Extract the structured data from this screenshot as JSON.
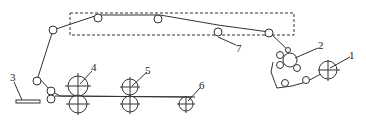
{
  "diagram": {
    "type": "web-path-roller-schematic",
    "colors": {
      "stroke": "#333333",
      "background": "#ffffff"
    },
    "labels": [
      {
        "id": "1",
        "text": "1",
        "x": 349,
        "y": 52
      },
      {
        "id": "2",
        "text": "2",
        "x": 318,
        "y": 42
      },
      {
        "id": "3",
        "text": "3",
        "x": 9,
        "y": 74
      },
      {
        "id": "4",
        "text": "4",
        "x": 91,
        "y": 63
      },
      {
        "id": "5",
        "text": "5",
        "x": 145,
        "y": 67
      },
      {
        "id": "6",
        "text": "6",
        "x": 199,
        "y": 81
      },
      {
        "id": "7",
        "text": "7",
        "x": 236,
        "y": 44
      }
    ],
    "components": [
      {
        "id": "1",
        "name": "unwind roll"
      },
      {
        "id": "2",
        "name": "roller group"
      },
      {
        "id": "3",
        "name": "output plate"
      },
      {
        "id": "4",
        "name": "nip roller pair"
      },
      {
        "id": "5",
        "name": "nip roller pair"
      },
      {
        "id": "6",
        "name": "roller"
      },
      {
        "id": "7",
        "name": "dashed enclosure (oven/chamber)"
      }
    ]
  }
}
